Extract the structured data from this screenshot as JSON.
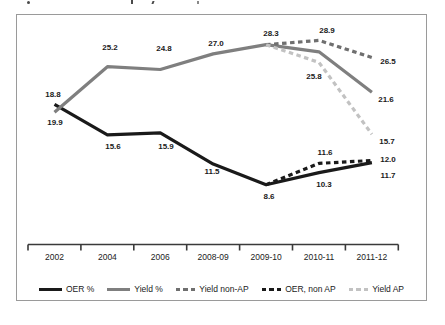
{
  "chart_data": {
    "type": "line",
    "title": "",
    "categories": [
      "2002",
      "2004",
      "2006",
      "2008-09",
      "2009-10",
      "2010-11",
      "2011-12"
    ],
    "series": [
      {
        "name": "OER %",
        "color": "#1a1a1a",
        "style": "solid",
        "values": [
          19.9,
          15.6,
          15.9,
          11.5,
          8.6,
          10.3,
          11.7
        ]
      },
      {
        "name": "Yield %",
        "color": "#7f7f7f",
        "style": "solid",
        "values": [
          18.8,
          25.2,
          24.8,
          27.0,
          28.3,
          27.3,
          21.6
        ]
      },
      {
        "name": "Yield non-AP",
        "color": "#6f6f6f",
        "style": "dashed",
        "values": [
          null,
          null,
          null,
          null,
          28.3,
          28.9,
          26.5
        ]
      },
      {
        "name": "OER, non AP",
        "color": "#1a1a1a",
        "style": "dashed",
        "values": [
          null,
          null,
          null,
          null,
          8.6,
          11.6,
          12.0
        ]
      },
      {
        "name": "Yield AP",
        "color": "#c2c2c2",
        "style": "dashed",
        "values": [
          null,
          null,
          null,
          null,
          28.3,
          25.8,
          15.7
        ]
      }
    ],
    "data_labels": [
      {
        "text": "18.8",
        "x": 53,
        "y": 95
      },
      {
        "text": "19.9",
        "x": 55,
        "y": 123
      },
      {
        "text": "25.2",
        "x": 110,
        "y": 48
      },
      {
        "text": "15.6",
        "x": 113,
        "y": 147
      },
      {
        "text": "24.8",
        "x": 164,
        "y": 49
      },
      {
        "text": "15.9",
        "x": 166,
        "y": 147
      },
      {
        "text": "27.0",
        "x": 216,
        "y": 44
      },
      {
        "text": "11.5",
        "x": 212,
        "y": 172
      },
      {
        "text": "28.3",
        "x": 271,
        "y": 34
      },
      {
        "text": "8.6",
        "x": 269,
        "y": 197
      },
      {
        "text": "28.9",
        "x": 327,
        "y": 31
      },
      {
        "text": "25.8",
        "x": 314,
        "y": 77
      },
      {
        "text": "11.6",
        "x": 325,
        "y": 153
      },
      {
        "text": "10.3",
        "x": 324,
        "y": 185
      },
      {
        "text": "26.5",
        "x": 388,
        "y": 62
      },
      {
        "text": "21.6",
        "x": 386,
        "y": 100
      },
      {
        "text": "15.7",
        "x": 387,
        "y": 142
      },
      {
        "text": "12.0",
        "x": 388,
        "y": 160
      },
      {
        "text": "11.7",
        "x": 388,
        "y": 176
      }
    ],
    "legend_position": "bottom",
    "y_axis_visible": false,
    "x_axis": {
      "line_color": "#3a3a3a",
      "tick_count": 8
    },
    "frame_border_color": "#9a9a9a"
  }
}
